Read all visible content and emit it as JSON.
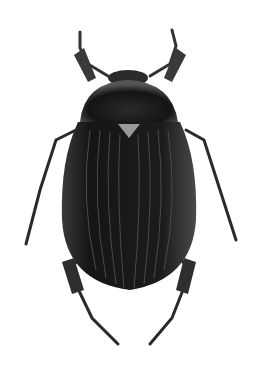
{
  "image": {
    "subject": "beetle",
    "view": "dorsal",
    "background": "#ffffff",
    "body_color": "#1a1a1a",
    "highlight_color": "#6a6a6a"
  }
}
